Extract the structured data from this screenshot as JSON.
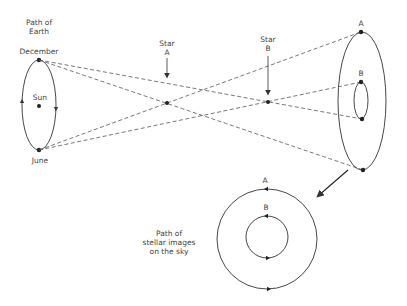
{
  "labels": {
    "path_of_earth": "Path of\nEarth",
    "december": "December",
    "june": "June",
    "sun": "Sun",
    "star_a": "Star\nA",
    "star_b": "Star\nB",
    "image_a_top": "A",
    "image_b_top": "B",
    "sky_a": "A",
    "sky_b": "B",
    "path_of_images": "Path of\nstellar images\non the sky"
  },
  "colors": {
    "line": "#333333",
    "dashed": "#555555",
    "text": "#444444"
  }
}
